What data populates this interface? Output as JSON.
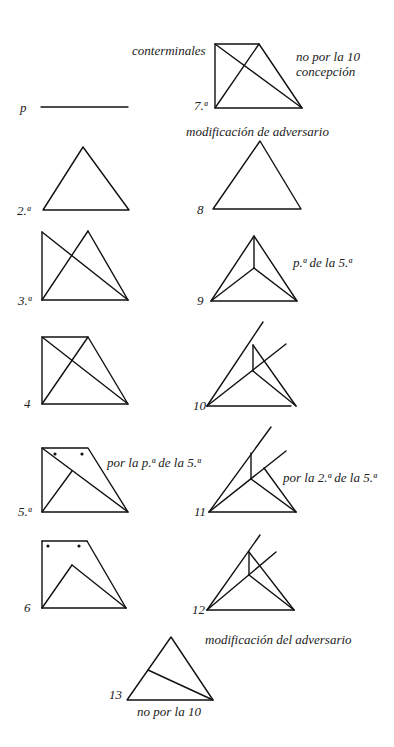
{
  "labels": {
    "p": "p",
    "fig2": "2.ª",
    "fig3": "3.ª",
    "fig4": "4",
    "fig5": "5.ª",
    "fig6": "6",
    "fig7": "7.ª",
    "fig8": "8",
    "fig9": "9",
    "fig10": "10",
    "fig11": "11",
    "fig12": "12",
    "fig13": "13"
  },
  "annotations": {
    "conterminales": "conterminales",
    "fig7_note_line1": "no por la 10",
    "fig7_note_line2": "concepción",
    "fig8_note": "modificación de adversario",
    "fig9_note": "p.ª de la 5.ª",
    "fig5_note": "por la p.ª de la 5.ª",
    "fig11_note": "por la 2.ª de la 5.ª",
    "fig13_note": "modificación del adversario",
    "fig13_sub": "no por la 10"
  }
}
